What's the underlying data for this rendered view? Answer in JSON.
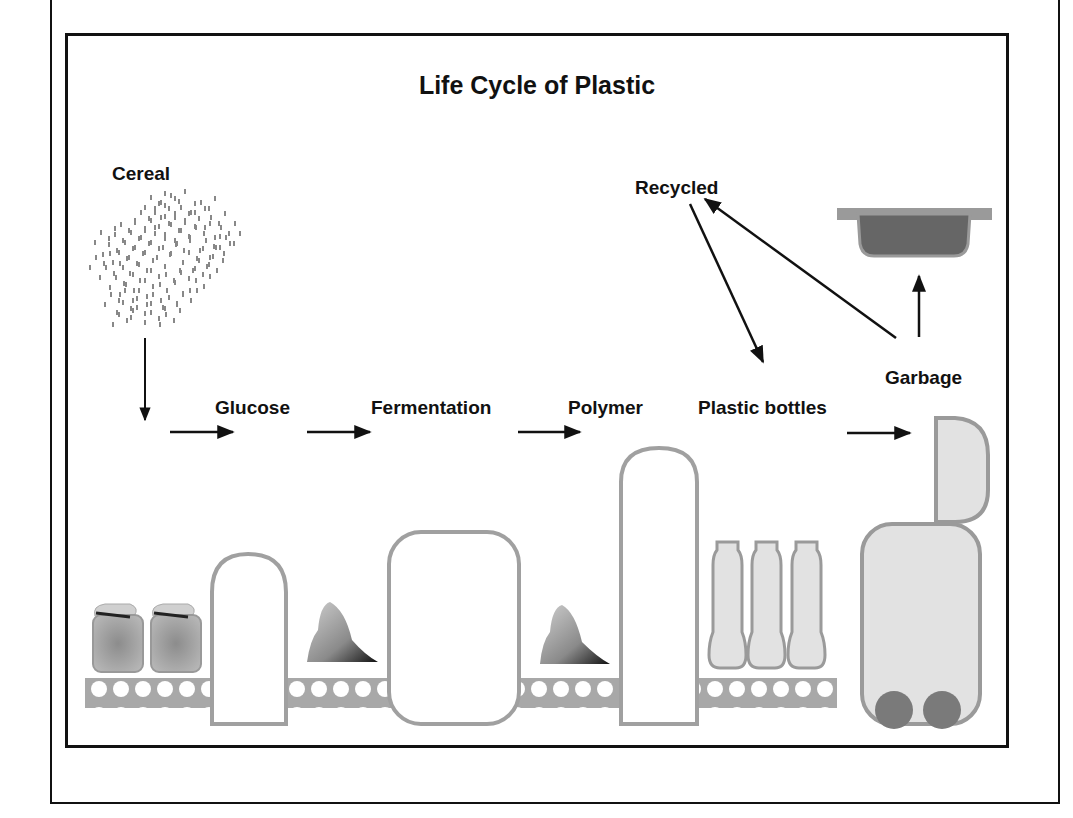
{
  "diagram": {
    "title": "Life Cycle of Plastic",
    "nodes": {
      "cereal": "Cereal",
      "glucose": "Glucose",
      "fermentation": "Fermentation",
      "polymer": "Polymer",
      "plastic_bottles": "Plastic bottles",
      "garbage": "Garbage",
      "recycled": "Recycled"
    },
    "icons": [
      "grain-scatter-icon",
      "sack-icon",
      "glucose-machine-icon",
      "powder-pile-icon",
      "fermentation-tank-icon",
      "polymer-tower-icon",
      "bottle-icon",
      "trash-bin-icon",
      "tray-icon",
      "conveyor-belt-icon"
    ],
    "edges": [
      {
        "from": "Cereal",
        "to": "Glucose"
      },
      {
        "from": "Glucose",
        "to": "Fermentation"
      },
      {
        "from": "Fermentation",
        "to": "Polymer"
      },
      {
        "from": "Polymer",
        "to": "Plastic bottles"
      },
      {
        "from": "Plastic bottles",
        "to": "Garbage"
      },
      {
        "from": "Garbage",
        "to": "Recycled"
      },
      {
        "from": "Garbage",
        "to": "Landfill tray"
      },
      {
        "from": "Recycled",
        "to": "Plastic bottles"
      }
    ],
    "colors": {
      "stroke": "#111111",
      "equipment": "#9a9a9a",
      "fill_light": "#e2e2e2",
      "wheel": "#7a7a7a",
      "tray": "#666666"
    }
  }
}
